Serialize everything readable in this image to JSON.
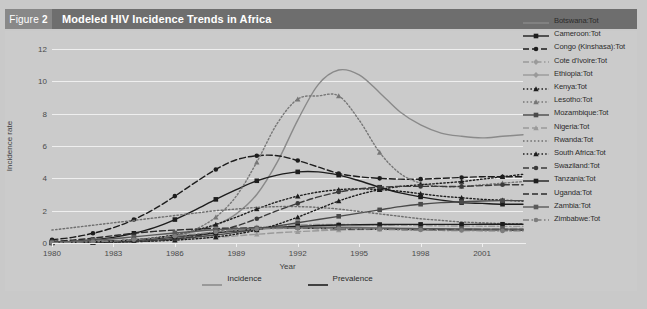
{
  "figure": {
    "badge_prefix": "Figure",
    "badge_number": "2",
    "title": "Modeled HIV Incidence Trends in Africa",
    "badge_bg": "#888888",
    "header_bg": "#6e6e6e",
    "panel_bg": "#cbcbcb",
    "page_bg": "#c9c9c9"
  },
  "bottom_legend": {
    "items": [
      {
        "label": "Incidence",
        "color": "#8c8c8c"
      },
      {
        "label": "Prevalence",
        "color": "#1d1d1d"
      }
    ]
  },
  "chart_data": {
    "type": "line",
    "title": "Modeled HIV Incidence Trends in Africa",
    "xlabel": "Year",
    "ylabel": "Incidence rate",
    "xlim": [
      1980,
      2003
    ],
    "ylim": [
      0,
      12
    ],
    "yticks": [
      0,
      2,
      4,
      6,
      8,
      10,
      12
    ],
    "xticks": [
      1980,
      1983,
      1986,
      1989,
      1992,
      1995,
      1998,
      2001
    ],
    "grid": true,
    "legend_position": "right",
    "x": [
      1980,
      1981,
      1982,
      1983,
      1984,
      1985,
      1986,
      1987,
      1988,
      1989,
      1990,
      1991,
      1992,
      1993,
      1994,
      1995,
      1996,
      1997,
      1998,
      1999,
      2000,
      2001,
      2002,
      2003
    ],
    "series": [
      {
        "name": "Botswana:Tot",
        "color": "#8a8a8a",
        "dash": "solid",
        "marker": "none",
        "values": [
          0.05,
          0.07,
          0.1,
          0.14,
          0.2,
          0.3,
          0.45,
          0.7,
          1.1,
          1.8,
          3.0,
          5.0,
          7.6,
          9.8,
          10.7,
          10.4,
          9.3,
          8.1,
          7.3,
          6.8,
          6.6,
          6.5,
          6.6,
          6.7
        ]
      },
      {
        "name": "Cameroon:Tot",
        "color": "#1d1d1d",
        "dash": "solid",
        "marker": "square",
        "values": [
          0.05,
          0.1,
          0.2,
          0.35,
          0.6,
          0.95,
          1.45,
          2.05,
          2.7,
          3.3,
          3.85,
          4.2,
          4.4,
          4.4,
          4.2,
          3.85,
          3.45,
          3.1,
          2.85,
          2.65,
          2.5,
          2.45,
          2.4,
          2.4
        ]
      },
      {
        "name": "Congo (Kinshasa):Tot",
        "color": "#1d1d1d",
        "dash": "dashed",
        "marker": "circle",
        "values": [
          0.2,
          0.35,
          0.6,
          0.95,
          1.45,
          2.1,
          2.9,
          3.75,
          4.55,
          5.15,
          5.4,
          5.4,
          5.1,
          4.7,
          4.3,
          4.1,
          4.0,
          3.95,
          3.95,
          4.0,
          4.05,
          4.1,
          4.1,
          4.1
        ]
      },
      {
        "name": "Cote d'Ivoire:Tot",
        "color": "#9a9a9a",
        "dash": "dashdot",
        "marker": "diamond",
        "values": [
          0.03,
          0.05,
          0.08,
          0.12,
          0.18,
          0.26,
          0.36,
          0.5,
          0.66,
          0.82,
          0.96,
          1.06,
          1.12,
          1.15,
          1.15,
          1.14,
          1.12,
          1.1,
          1.08,
          1.06,
          1.05,
          1.04,
          1.03,
          1.03
        ]
      },
      {
        "name": "Ethiopia:Tot",
        "color": "#9a9a9a",
        "dash": "solid",
        "marker": "diamond",
        "values": [
          0.02,
          0.04,
          0.06,
          0.1,
          0.16,
          0.24,
          0.34,
          0.46,
          0.6,
          0.74,
          0.86,
          0.95,
          1.0,
          1.02,
          1.0,
          0.97,
          0.93,
          0.9,
          0.87,
          0.85,
          0.83,
          0.82,
          0.81,
          0.8
        ]
      },
      {
        "name": "Kenya:Tot",
        "color": "#1d1d1d",
        "dash": "dotted",
        "marker": "triangle",
        "values": [
          0.02,
          0.04,
          0.07,
          0.12,
          0.2,
          0.32,
          0.5,
          0.78,
          1.15,
          1.6,
          2.1,
          2.55,
          2.9,
          3.15,
          3.3,
          3.35,
          3.3,
          3.2,
          3.05,
          2.9,
          2.8,
          2.7,
          2.65,
          2.6
        ]
      },
      {
        "name": "Lesotho:Tot",
        "color": "#777777",
        "dash": "dotted",
        "marker": "triangle",
        "values": [
          0.02,
          0.03,
          0.05,
          0.09,
          0.15,
          0.25,
          0.45,
          0.85,
          1.6,
          2.9,
          5.0,
          7.4,
          8.9,
          9.1,
          9.1,
          7.6,
          5.6,
          4.3,
          3.7,
          3.5,
          3.5,
          3.6,
          3.7,
          3.8
        ]
      },
      {
        "name": "Mozambique:Tot",
        "color": "#4a4a4a",
        "dash": "solid",
        "marker": "square",
        "values": [
          0.02,
          0.03,
          0.05,
          0.08,
          0.12,
          0.18,
          0.26,
          0.36,
          0.5,
          0.66,
          0.85,
          1.05,
          1.25,
          1.45,
          1.65,
          1.85,
          2.05,
          2.25,
          2.4,
          2.5,
          2.55,
          2.6,
          2.62,
          2.62
        ]
      },
      {
        "name": "Nigeria:Tot",
        "color": "#9a9a9a",
        "dash": "dashed",
        "marker": "triangle",
        "values": [
          0.02,
          0.03,
          0.05,
          0.07,
          0.1,
          0.14,
          0.2,
          0.27,
          0.35,
          0.44,
          0.54,
          0.63,
          0.7,
          0.76,
          0.8,
          0.83,
          0.85,
          0.86,
          0.87,
          0.88,
          0.88,
          0.89,
          0.89,
          0.9
        ]
      },
      {
        "name": "Rwanda:Tot",
        "color": "#6e6e6e",
        "dash": "dotted",
        "marker": "none",
        "values": [
          0.8,
          0.95,
          1.1,
          1.25,
          1.4,
          1.55,
          1.7,
          1.85,
          2.0,
          2.1,
          2.2,
          2.25,
          2.25,
          2.2,
          2.1,
          1.95,
          1.8,
          1.65,
          1.5,
          1.4,
          1.3,
          1.25,
          1.2,
          1.2
        ]
      },
      {
        "name": "South Africa:Tot",
        "color": "#1d1d1d",
        "dash": "dotted",
        "marker": "triangle",
        "values": [
          0.01,
          0.02,
          0.03,
          0.05,
          0.08,
          0.12,
          0.18,
          0.26,
          0.38,
          0.55,
          0.8,
          1.15,
          1.6,
          2.1,
          2.6,
          3.0,
          3.3,
          3.5,
          3.6,
          3.7,
          3.8,
          3.95,
          4.1,
          4.25
        ]
      },
      {
        "name": "Swaziland:Tot",
        "color": "#3a3a3a",
        "dash": "dashed",
        "marker": "circle",
        "values": [
          0.01,
          0.02,
          0.03,
          0.05,
          0.09,
          0.15,
          0.25,
          0.42,
          0.7,
          1.05,
          1.5,
          2.0,
          2.45,
          2.85,
          3.15,
          3.35,
          3.45,
          3.5,
          3.5,
          3.5,
          3.5,
          3.55,
          3.6,
          3.6
        ]
      },
      {
        "name": "Tanzania:Tot",
        "color": "#1d1d1d",
        "dash": "solid",
        "marker": "square",
        "values": [
          0.02,
          0.04,
          0.07,
          0.12,
          0.18,
          0.27,
          0.38,
          0.5,
          0.63,
          0.76,
          0.87,
          0.96,
          1.03,
          1.08,
          1.11,
          1.13,
          1.14,
          1.15,
          1.15,
          1.15,
          1.15,
          1.16,
          1.16,
          1.16
        ]
      },
      {
        "name": "Uganda:Tot",
        "color": "#2b2b2b",
        "dash": "dashed",
        "marker": "none",
        "values": [
          0.1,
          0.18,
          0.3,
          0.45,
          0.6,
          0.72,
          0.8,
          0.86,
          0.9,
          0.92,
          0.93,
          0.93,
          0.92,
          0.9,
          0.88,
          0.86,
          0.85,
          0.84,
          0.83,
          0.82,
          0.82,
          0.81,
          0.81,
          0.8
        ]
      },
      {
        "name": "Zambia:Tot",
        "color": "#5a5a5a",
        "dash": "solid",
        "marker": "square",
        "values": [
          0.05,
          0.1,
          0.17,
          0.26,
          0.38,
          0.5,
          0.62,
          0.73,
          0.82,
          0.88,
          0.92,
          0.94,
          0.95,
          0.95,
          0.94,
          0.93,
          0.92,
          0.9,
          0.89,
          0.88,
          0.87,
          0.86,
          0.86,
          0.85
        ]
      },
      {
        "name": "Zimbabwe:Tot",
        "color": "#7d7d7d",
        "dash": "dashdot",
        "marker": "circle",
        "values": [
          0.02,
          0.04,
          0.07,
          0.12,
          0.2,
          0.3,
          0.42,
          0.55,
          0.68,
          0.78,
          0.86,
          0.9,
          0.92,
          0.92,
          0.9,
          0.88,
          0.85,
          0.82,
          0.8,
          0.78,
          0.77,
          0.76,
          0.75,
          0.75
        ]
      }
    ]
  }
}
